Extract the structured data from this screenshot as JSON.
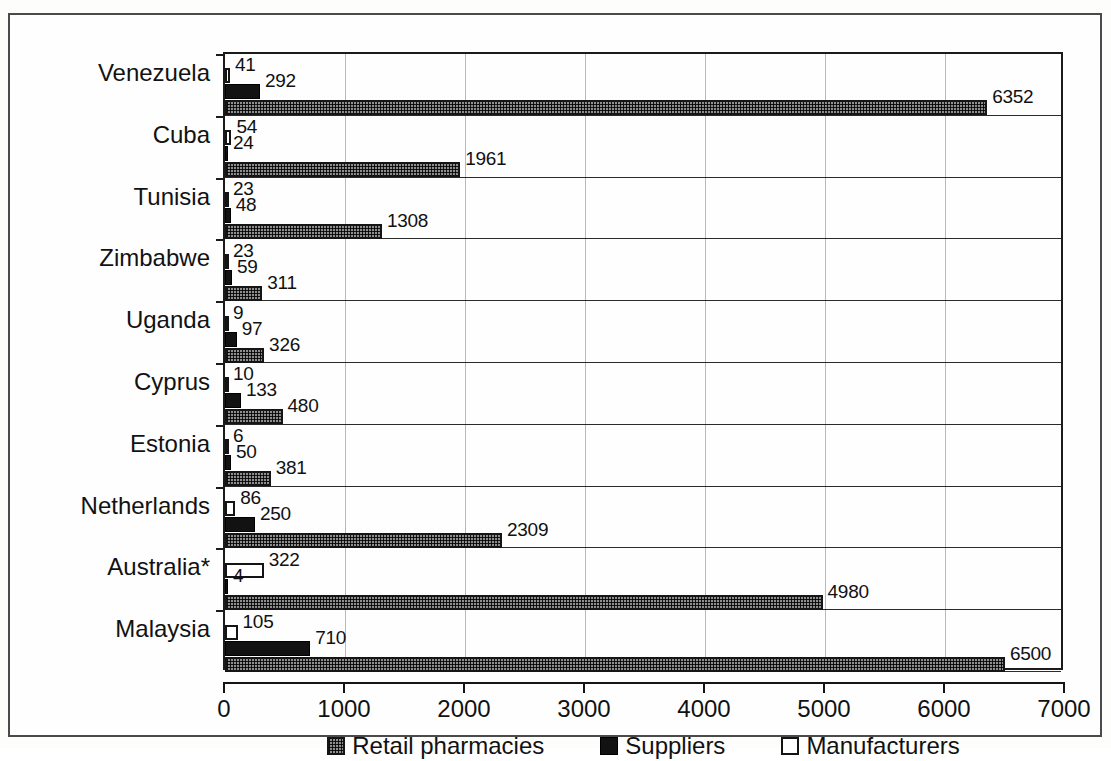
{
  "chart_data": {
    "type": "bar",
    "orientation": "horizontal",
    "title": "",
    "subtitle": "",
    "xlabel": "",
    "ylabel": "",
    "xlim": [
      0,
      7000
    ],
    "xticks": [
      0,
      1000,
      2000,
      3000,
      4000,
      5000,
      6000,
      7000
    ],
    "xtick_labels": [
      "0",
      "1000",
      "2000",
      "3000",
      "4000",
      "5000",
      "6000",
      "7000"
    ],
    "grid": "vertical",
    "legend_position": "bottom",
    "categories": [
      "Venezuela",
      "Cuba",
      "Tunisia",
      "Zimbabwe",
      "Uganda",
      "Cyprus",
      "Estonia",
      "Netherlands",
      "Australia*",
      "Malaysia"
    ],
    "series": [
      {
        "name": "Manufacturers",
        "color": "#ffffff",
        "pattern": "open",
        "values": [
          41,
          54,
          23,
          23,
          9,
          10,
          6,
          86,
          322,
          105
        ]
      },
      {
        "name": "Suppliers",
        "color": "#121212",
        "pattern": "solid",
        "values": [
          292,
          24,
          48,
          59,
          97,
          133,
          50,
          250,
          4,
          710
        ]
      },
      {
        "name": "Retail pharmacies",
        "color": "#8e8e8e",
        "pattern": "crosshatch",
        "values": [
          6352,
          1961,
          1308,
          311,
          326,
          480,
          381,
          2309,
          4980,
          6500
        ]
      }
    ],
    "data_labels": {
      "Venezuela": {
        "Manufacturers": "41",
        "Suppliers": "292",
        "Retail pharmacies": "6352"
      },
      "Cuba": {
        "Manufacturers": "54",
        "Suppliers": "24",
        "Retail pharmacies": "1961"
      },
      "Tunisia": {
        "Manufacturers": "23",
        "Suppliers": "48",
        "Retail pharmacies": "1308"
      },
      "Zimbabwe": {
        "Manufacturers": "23",
        "Suppliers": "59",
        "Retail pharmacies": "311"
      },
      "Uganda": {
        "Manufacturers": "9",
        "Suppliers": "97",
        "Retail pharmacies": "326"
      },
      "Cyprus": {
        "Manufacturers": "10",
        "Suppliers": "133",
        "Retail pharmacies": "480"
      },
      "Estonia": {
        "Manufacturers": "6",
        "Suppliers": "50",
        "Retail pharmacies": "381"
      },
      "Netherlands": {
        "Manufacturers": "86",
        "Suppliers": "250",
        "Retail pharmacies": "2309"
      },
      "Australia*": {
        "Manufacturers": "322",
        "Suppliers": "4",
        "Retail pharmacies": "4980"
      },
      "Malaysia": {
        "Manufacturers": "105",
        "Suppliers": "710",
        "Retail pharmacies": "6500"
      }
    }
  },
  "legend": {
    "items": [
      {
        "label": "Retail pharmacies",
        "key": "retail"
      },
      {
        "label": "Suppliers",
        "key": "supp"
      },
      {
        "label": "Manufacturers",
        "key": "manu"
      }
    ]
  },
  "colors": {
    "axis": "#1b1b1b",
    "gridline": "#b9b9b9",
    "text": "#111111",
    "page": "#fefefe",
    "frame": "#4a4a4a"
  }
}
